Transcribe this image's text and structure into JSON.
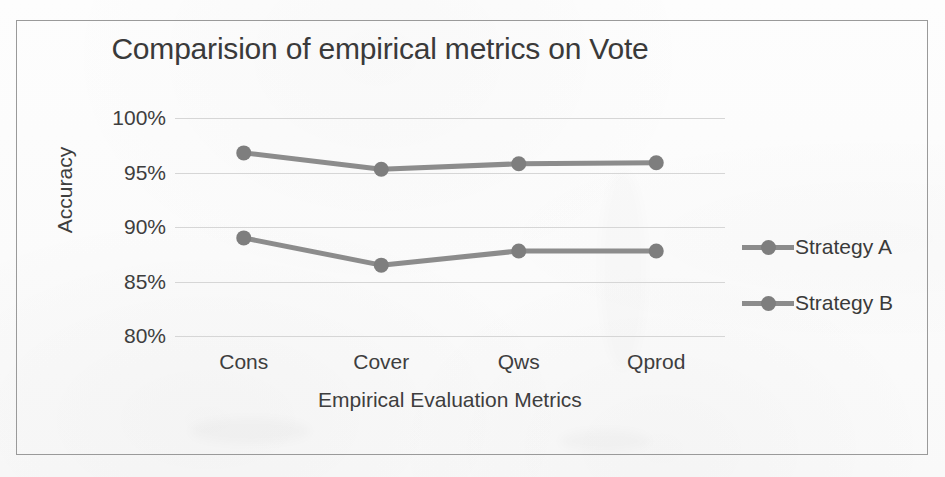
{
  "page": {
    "background_color": "#fbfbfb",
    "frame_color": "#9a9a9a"
  },
  "chart_data": {
    "type": "line",
    "title": "Comparision of empirical metrics on Vote",
    "xlabel": "Empirical Evaluation Metrics",
    "ylabel": "Accuracy",
    "categories": [
      "Cons",
      "Cover",
      "Qws",
      "Qprod"
    ],
    "ytick_labels": [
      "100%",
      "95%",
      "90%",
      "85%",
      "80%"
    ],
    "ytick_values": [
      100,
      95,
      90,
      85,
      80
    ],
    "ylim": [
      80,
      100
    ],
    "grid": true,
    "legend_position": "right",
    "series": [
      {
        "name": "Strategy A",
        "color": "#8c8c8c",
        "marker_color": "#7e7e7e",
        "values": [
          96.8,
          95.3,
          95.8,
          95.9
        ]
      },
      {
        "name": "Strategy B",
        "color": "#8c8c8c",
        "marker_color": "#7e7e7e",
        "values": [
          89.0,
          86.5,
          87.8,
          87.8
        ]
      }
    ]
  }
}
